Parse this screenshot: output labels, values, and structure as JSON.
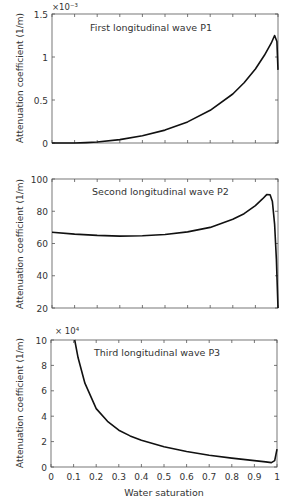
{
  "chart_data": [
    {
      "type": "line",
      "title": "First longitudinal wave P1",
      "xlabel": "",
      "ylabel": "Attenuation coefficient (1/m)",
      "y_multiplier": "×10⁻³",
      "xlim": [
        0,
        1
      ],
      "ylim": [
        0,
        1.5
      ],
      "xticks": [
        0,
        0.1,
        0.2,
        0.3,
        0.4,
        0.5,
        0.6,
        0.7,
        0.8,
        0.9,
        1
      ],
      "xtick_labels_visible": false,
      "yticks": [
        0,
        0.5,
        1,
        1.5
      ],
      "ytick_labels": [
        "0",
        "0.5",
        "1",
        "1.5"
      ],
      "grid": false,
      "series": [
        {
          "name": "P1",
          "x": [
            0,
            0.1,
            0.15,
            0.2,
            0.3,
            0.4,
            0.5,
            0.6,
            0.7,
            0.8,
            0.85,
            0.9,
            0.94,
            0.97,
            0.985,
            0.995,
            1.0
          ],
          "y": [
            0,
            0,
            0.005,
            0.012,
            0.04,
            0.085,
            0.15,
            0.245,
            0.38,
            0.57,
            0.7,
            0.86,
            1.02,
            1.16,
            1.25,
            1.18,
            0.85
          ]
        }
      ]
    },
    {
      "type": "line",
      "title": "Second longitudinal wave P2",
      "xlabel": "",
      "ylabel": "Attenuation coefficient (1/m)",
      "xlim": [
        0,
        1
      ],
      "ylim": [
        20,
        100
      ],
      "xticks": [
        0,
        0.1,
        0.2,
        0.3,
        0.4,
        0.5,
        0.6,
        0.7,
        0.8,
        0.9,
        1
      ],
      "xtick_labels_visible": false,
      "yticks": [
        20,
        40,
        60,
        80,
        100
      ],
      "ytick_labels": [
        "20",
        "40",
        "60",
        "80",
        "100"
      ],
      "grid": false,
      "series": [
        {
          "name": "P2",
          "x": [
            0,
            0.1,
            0.2,
            0.3,
            0.4,
            0.5,
            0.6,
            0.7,
            0.8,
            0.85,
            0.9,
            0.93,
            0.95,
            0.965,
            0.975,
            0.985,
            0.993,
            1.0
          ],
          "y": [
            67,
            65.8,
            65,
            64.6,
            64.8,
            65.6,
            67.2,
            70,
            75,
            78.5,
            83.5,
            87.5,
            90.3,
            90.2,
            86,
            72,
            50,
            20
          ]
        }
      ]
    },
    {
      "type": "line",
      "title": "Third longitudinal wave P3",
      "xlabel": "Water saturation",
      "ylabel": "Attenuation coefficient (1/m)",
      "y_multiplier": "× 10⁴",
      "xlim": [
        0,
        1
      ],
      "ylim": [
        0,
        10
      ],
      "xticks": [
        0,
        0.1,
        0.2,
        0.3,
        0.4,
        0.5,
        0.6,
        0.7,
        0.8,
        0.9,
        1
      ],
      "xtick_labels": [
        "0",
        "0.1",
        "0.2",
        "0.3",
        "0.4",
        "0.5",
        "0.6",
        "0.7",
        "0.8",
        "0.9",
        "1"
      ],
      "yticks": [
        0,
        2,
        4,
        6,
        8,
        10
      ],
      "ytick_labels": [
        "0",
        "2",
        "4",
        "6",
        "8",
        "10"
      ],
      "grid": false,
      "series": [
        {
          "name": "P3",
          "x": [
            0.105,
            0.12,
            0.15,
            0.2,
            0.25,
            0.3,
            0.35,
            0.4,
            0.5,
            0.6,
            0.7,
            0.8,
            0.9,
            0.95,
            0.975,
            0.99,
            1.0
          ],
          "y": [
            10,
            8.6,
            6.6,
            4.6,
            3.6,
            2.9,
            2.45,
            2.1,
            1.6,
            1.22,
            0.92,
            0.7,
            0.5,
            0.4,
            0.35,
            0.5,
            1.4
          ]
        }
      ]
    }
  ],
  "layout": {
    "panels": [
      {
        "left": 52,
        "right": 278,
        "top": 14,
        "bottom": 143
      },
      {
        "left": 52,
        "right": 278,
        "top": 179,
        "bottom": 308
      },
      {
        "left": 51,
        "right": 277,
        "top": 340,
        "bottom": 467
      }
    ],
    "line_color": "#111111",
    "axis_color": "#555555",
    "text_color": "#333333"
  }
}
